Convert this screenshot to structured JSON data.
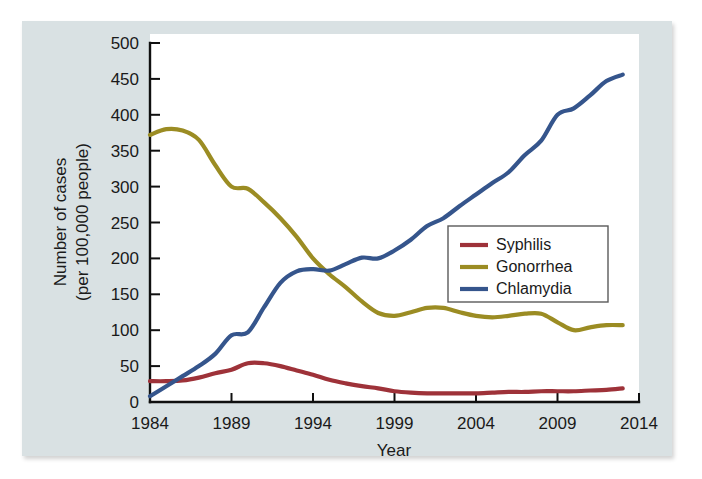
{
  "chart_data": {
    "type": "line",
    "title": "",
    "xlabel": "Year",
    "ylabel": "Number of cases (per 100,000 people)",
    "ylabel_line1": "Number of cases",
    "ylabel_line2": "(per 100,000 people)",
    "xlim": [
      1984,
      2014
    ],
    "ylim": [
      0,
      500
    ],
    "grid": false,
    "legend_position": "center-right",
    "xticks": [
      1984,
      1989,
      1994,
      1999,
      2004,
      2009,
      2014
    ],
    "xtick_labels": [
      "1984",
      "1989",
      "1994",
      "1999",
      "2004",
      "2009",
      "2014"
    ],
    "yticks": [
      0,
      50,
      100,
      150,
      200,
      250,
      300,
      350,
      400,
      450,
      500
    ],
    "ytick_labels": [
      "0",
      "50",
      "100",
      "150",
      "200",
      "250",
      "300",
      "350",
      "400",
      "450",
      "500"
    ],
    "x": [
      1984,
      1985,
      1986,
      1987,
      1988,
      1989,
      1990,
      1991,
      1992,
      1993,
      1994,
      1995,
      1996,
      1997,
      1998,
      1999,
      2000,
      2001,
      2002,
      2003,
      2004,
      2005,
      2006,
      2007,
      2008,
      2009,
      2010,
      2011,
      2012,
      2013
    ],
    "series": [
      {
        "name": "Syphilis",
        "color": "#9e3239",
        "values": [
          29,
          29,
          30,
          34,
          40,
          45,
          54,
          54,
          50,
          44,
          38,
          31,
          26,
          22,
          19,
          15,
          13,
          12,
          12,
          12,
          12,
          13,
          14,
          14,
          15,
          15,
          15,
          16,
          17,
          19
        ]
      },
      {
        "name": "Gonorrhea",
        "color": "#9b8c23",
        "values": [
          372,
          380,
          378,
          365,
          330,
          300,
          297,
          278,
          256,
          230,
          200,
          178,
          160,
          140,
          124,
          120,
          125,
          131,
          131,
          125,
          120,
          118,
          120,
          123,
          123,
          111,
          100,
          104,
          107,
          107
        ]
      },
      {
        "name": "Chlamydia",
        "color": "#35558c",
        "values": [
          8,
          22,
          36,
          50,
          67,
          93,
          97,
          132,
          166,
          182,
          185,
          183,
          192,
          201,
          200,
          211,
          226,
          245,
          256,
          273,
          289,
          305,
          320,
          344,
          364,
          400,
          409,
          427,
          447,
          456
        ]
      }
    ],
    "final_points": {
      "Chlamydia": 448,
      "Gonorrhea": 107,
      "Syphilis": 19
    }
  },
  "legend": {
    "items": [
      {
        "label": "Syphilis",
        "color": "#9e3239"
      },
      {
        "label": "Gonorrhea",
        "color": "#9b8c23"
      },
      {
        "label": "Chlamydia",
        "color": "#35558c"
      }
    ]
  },
  "colors": {
    "panel_background": "#d9e1e3",
    "plot_background": "#ffffff",
    "axis": "#101010",
    "text": "#1a1a1a"
  }
}
